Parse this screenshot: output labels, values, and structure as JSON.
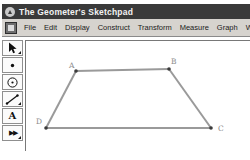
{
  "window": {
    "title": "The Geometer's Sketchpad"
  },
  "menubar": {
    "items": [
      {
        "label": "File"
      },
      {
        "label": "Edit"
      },
      {
        "label": "Display"
      },
      {
        "label": "Construct"
      },
      {
        "label": "Transform"
      },
      {
        "label": "Measure"
      },
      {
        "label": "Graph"
      },
      {
        "label": "W"
      }
    ]
  },
  "toolbar": {
    "tools": [
      {
        "name": "selection-arrow-tool",
        "has_flyout": true
      },
      {
        "name": "point-tool",
        "has_flyout": false
      },
      {
        "name": "compass-tool",
        "has_flyout": false
      },
      {
        "name": "straightedge-tool",
        "has_flyout": true
      },
      {
        "name": "text-tool",
        "glyph": "A",
        "has_flyout": false
      },
      {
        "name": "custom-tool",
        "glyph": "▶▶",
        "has_flyout": true
      }
    ]
  },
  "canvas": {
    "figure": {
      "type": "polygon",
      "shape": "trapezoid",
      "colors": {
        "edge_stroke": "#9a9a9a",
        "point_fill": "#3b3b3b",
        "label_color": "#8c8c8c"
      },
      "vertices": [
        {
          "label": "A",
          "x": 50,
          "y": 30,
          "lx": 43,
          "ly": 27
        },
        {
          "label": "B",
          "x": 143,
          "y": 28,
          "lx": 145,
          "ly": 23
        },
        {
          "label": "C",
          "x": 185,
          "y": 87,
          "lx": 192,
          "ly": 90
        },
        {
          "label": "D",
          "x": 20,
          "y": 87,
          "lx": 10,
          "ly": 83
        }
      ],
      "edges": [
        [
          "A",
          "B"
        ],
        [
          "B",
          "C"
        ],
        [
          "C",
          "D"
        ],
        [
          "D",
          "A"
        ]
      ]
    }
  }
}
